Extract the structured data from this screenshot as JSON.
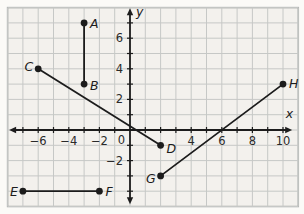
{
  "chart_data": {
    "type": "scatter",
    "title": "",
    "points": [
      {
        "label": "A",
        "x": -3,
        "y": 7,
        "label_anchor": "start",
        "label_dx": 6,
        "label_dy": 5
      },
      {
        "label": "B",
        "x": -3,
        "y": 3,
        "label_anchor": "start",
        "label_dx": 6,
        "label_dy": 6
      },
      {
        "label": "C",
        "x": -6,
        "y": 4,
        "label_anchor": "end",
        "label_dx": -5,
        "label_dy": 2
      },
      {
        "label": "D",
        "x": 2,
        "y": -1,
        "label_anchor": "start",
        "label_dx": 6,
        "label_dy": 8
      },
      {
        "label": "E",
        "x": -7,
        "y": -4,
        "label_anchor": "end",
        "label_dx": -5,
        "label_dy": 5
      },
      {
        "label": "F",
        "x": -2,
        "y": -4,
        "label_anchor": "start",
        "label_dx": 6,
        "label_dy": 5
      },
      {
        "label": "G",
        "x": 2,
        "y": -3,
        "label_anchor": "end",
        "label_dx": -5,
        "label_dy": 7
      },
      {
        "label": "H",
        "x": 10,
        "y": 3,
        "label_anchor": "start",
        "label_dx": 6,
        "label_dy": 4
      }
    ],
    "segments": [
      [
        "A",
        "B"
      ],
      [
        "C",
        "D"
      ],
      [
        "E",
        "F"
      ],
      [
        "G",
        "H"
      ]
    ],
    "x_axis": {
      "label": "x",
      "range": [
        -8,
        11
      ],
      "tick_step": 1,
      "labeled_ticks": [
        -6,
        -4,
        -2,
        4,
        6,
        8,
        10
      ]
    },
    "y_axis": {
      "label": "y",
      "range": [
        -5,
        8
      ],
      "tick_step": 1,
      "labeled_ticks": [
        6,
        4,
        2,
        -2
      ]
    },
    "origin_label": "0",
    "grid": true,
    "legend": false,
    "layout": {
      "width": 304,
      "height": 214,
      "unit_px": 15.3,
      "origin_px": [
        130,
        130
      ],
      "x_axis_extent": [
        -7.9,
        10.6
      ],
      "y_axis_extent": [
        -4.85,
        7.95
      ]
    },
    "colors": {
      "page_bg": "#fbfaf7",
      "plot_bg": "#f3f1ed",
      "grid_line": "#c6c8c6",
      "plot_border": "#a5a8a7",
      "ink": "#1c1c1c",
      "tick_text": "#2a2a2a"
    }
  }
}
